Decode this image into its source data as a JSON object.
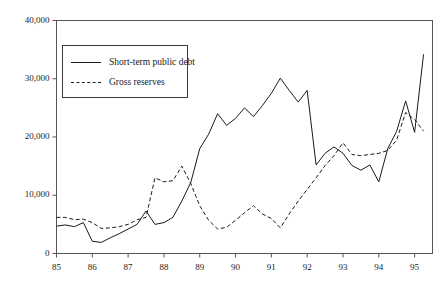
{
  "chart_data": {
    "type": "line",
    "title": "",
    "subtitle": "",
    "xlabel": "",
    "ylabel": "",
    "xlim": [
      1985.0,
      1995.5
    ],
    "ylim": [
      0,
      40000
    ],
    "grid": false,
    "legend_position": "upper-left",
    "x_tick_labels": [
      "85",
      "86",
      "87",
      "88",
      "89",
      "90",
      "91",
      "92",
      "93",
      "94",
      "95"
    ],
    "x_tick_values": [
      1985,
      1986,
      1987,
      1988,
      1989,
      1990,
      1991,
      1992,
      1993,
      1994,
      1995
    ],
    "y_tick_labels": [
      "0",
      "10,000",
      "20,000",
      "30,000",
      "40,000"
    ],
    "y_tick_values": [
      0,
      10000,
      20000,
      30000,
      40000
    ],
    "x": [
      1985.0,
      1985.25,
      1985.5,
      1985.75,
      1986.0,
      1986.25,
      1986.5,
      1986.75,
      1987.0,
      1987.25,
      1987.5,
      1987.75,
      1988.0,
      1988.25,
      1988.5,
      1988.75,
      1989.0,
      1989.25,
      1989.5,
      1989.75,
      1990.0,
      1990.25,
      1990.5,
      1990.75,
      1991.0,
      1991.25,
      1991.5,
      1991.75,
      1992.0,
      1992.25,
      1992.5,
      1992.75,
      1993.0,
      1993.25,
      1993.5,
      1993.75,
      1994.0,
      1994.25,
      1994.5,
      1994.75,
      1995.0,
      1995.25
    ],
    "series": [
      {
        "name": "Short-term public debt",
        "style": "solid",
        "color": "#1a1a1a",
        "values": [
          4700,
          4900,
          4600,
          5300,
          2100,
          1900,
          2700,
          3400,
          4200,
          5000,
          7300,
          5000,
          5300,
          6200,
          9000,
          12200,
          18000,
          20500,
          24000,
          22000,
          23200,
          25000,
          23500,
          25400,
          27500,
          30100,
          28000,
          26000,
          28000,
          15200,
          17200,
          18300,
          17200,
          15100,
          14300,
          15200,
          12300,
          18000,
          21000,
          26200,
          20800,
          34200
        ]
      },
      {
        "name": "Gross reserves",
        "style": "dashed",
        "color": "#1a1a1a",
        "values": [
          6200,
          6200,
          5800,
          5900,
          5300,
          4300,
          4400,
          4600,
          5000,
          5800,
          6200,
          13000,
          12300,
          12500,
          15000,
          12000,
          8200,
          5700,
          4200,
          4500,
          5700,
          7000,
          8200,
          6800,
          6000,
          4400,
          6800,
          9000,
          11000,
          13000,
          15100,
          16800,
          19000,
          17000,
          16800,
          17000,
          17200,
          17700,
          19500,
          24200,
          23000,
          21000
        ]
      }
    ],
    "annotations": []
  },
  "axis": {
    "y_labels": [
      "40,000",
      "30,000",
      "20,000",
      "10,000",
      "0"
    ],
    "x_labels": [
      "85",
      "86",
      "87",
      "88",
      "89",
      "90",
      "91",
      "92",
      "93",
      "94",
      "95"
    ]
  },
  "legend": {
    "entries": [
      {
        "label": "Short-term public debt",
        "style": "solid"
      },
      {
        "label": "Gross reserves",
        "style": "dashed"
      }
    ]
  }
}
